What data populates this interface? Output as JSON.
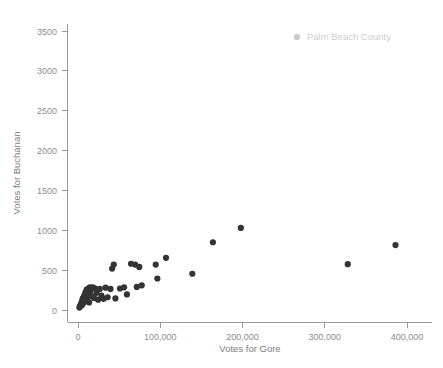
{
  "chart_data": {
    "type": "scatter",
    "title": "",
    "xlabel": "Votes for Gore",
    "ylabel": "Votes for Buchanan",
    "xlim": [
      -15000,
      415000
    ],
    "ylim": [
      -120,
      3650
    ],
    "xticks": [
      0,
      100000,
      200000,
      300000,
      400000
    ],
    "xticklabels": [
      "0",
      "100,000",
      "200,000",
      "300,000",
      "400,000"
    ],
    "yticks": [
      0,
      500,
      1000,
      1500,
      2000,
      2500,
      3000,
      3500
    ],
    "yticklabels": [
      "0",
      "500",
      "1000",
      "1500",
      "2000",
      "2500",
      "3000",
      "3500"
    ],
    "grid": false,
    "legend": {
      "position": "top-right",
      "entries": [
        {
          "label": "Palm Beach County",
          "marker": "circle",
          "color": "#c9c9c9"
        }
      ]
    },
    "series": [
      {
        "name": "Florida counties",
        "marker": "circle",
        "color": "#333333",
        "points": [
          {
            "x": 1700,
            "y": 30
          },
          {
            "x": 2400,
            "y": 45
          },
          {
            "x": 3000,
            "y": 55
          },
          {
            "x": 3600,
            "y": 70
          },
          {
            "x": 4100,
            "y": 90
          },
          {
            "x": 4700,
            "y": 60
          },
          {
            "x": 5200,
            "y": 120
          },
          {
            "x": 5900,
            "y": 145
          },
          {
            "x": 6300,
            "y": 85
          },
          {
            "x": 6900,
            "y": 160
          },
          {
            "x": 7400,
            "y": 105
          },
          {
            "x": 8000,
            "y": 190
          },
          {
            "x": 8600,
            "y": 130
          },
          {
            "x": 9200,
            "y": 225
          },
          {
            "x": 9800,
            "y": 170
          },
          {
            "x": 10500,
            "y": 255
          },
          {
            "x": 11200,
            "y": 120
          },
          {
            "x": 12000,
            "y": 200
          },
          {
            "x": 12800,
            "y": 270
          },
          {
            "x": 13500,
            "y": 95
          },
          {
            "x": 14300,
            "y": 285
          },
          {
            "x": 15200,
            "y": 240
          },
          {
            "x": 16500,
            "y": 175
          },
          {
            "x": 18000,
            "y": 285
          },
          {
            "x": 19500,
            "y": 150
          },
          {
            "x": 21000,
            "y": 270
          },
          {
            "x": 22500,
            "y": 215
          },
          {
            "x": 24500,
            "y": 130
          },
          {
            "x": 26500,
            "y": 265
          },
          {
            "x": 28500,
            "y": 180
          },
          {
            "x": 31000,
            "y": 140
          },
          {
            "x": 33500,
            "y": 280
          },
          {
            "x": 36000,
            "y": 160
          },
          {
            "x": 39500,
            "y": 265
          },
          {
            "x": 41500,
            "y": 520
          },
          {
            "x": 43500,
            "y": 570
          },
          {
            "x": 45500,
            "y": 145
          },
          {
            "x": 51000,
            "y": 270
          },
          {
            "x": 56000,
            "y": 285
          },
          {
            "x": 59500,
            "y": 195
          },
          {
            "x": 64500,
            "y": 580
          },
          {
            "x": 69500,
            "y": 570
          },
          {
            "x": 71500,
            "y": 290
          },
          {
            "x": 74500,
            "y": 540
          },
          {
            "x": 77500,
            "y": 310
          },
          {
            "x": 94500,
            "y": 570
          },
          {
            "x": 96500,
            "y": 395
          },
          {
            "x": 107000,
            "y": 655
          },
          {
            "x": 139000,
            "y": 455
          },
          {
            "x": 164000,
            "y": 850
          },
          {
            "x": 198000,
            "y": 1030
          },
          {
            "x": 328000,
            "y": 575
          },
          {
            "x": 386000,
            "y": 815
          }
        ]
      }
    ]
  }
}
